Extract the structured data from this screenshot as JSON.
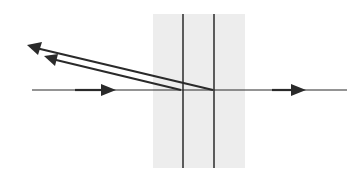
{
  "diagram": {
    "type": "thin-film-reflection",
    "background": "#ffffff",
    "line_color": "#2a2a2a",
    "film_shade_color": "#ededed",
    "film_region": {
      "x1": 153,
      "x2": 245,
      "y1": 14,
      "y2": 168
    },
    "interfaces": [
      {
        "name": "front-surface",
        "x": 183,
        "y1": 14,
        "y2": 168
      },
      {
        "name": "back-surface",
        "x": 214,
        "y1": 14,
        "y2": 168
      }
    ],
    "axis": {
      "y": 90,
      "x1": 32,
      "x2": 347
    },
    "rays": [
      {
        "name": "incident-ray",
        "from": [
          32,
          90
        ],
        "to": [
          183,
          90
        ],
        "arrow_at": [
          115,
          90
        ],
        "direction": "right"
      },
      {
        "name": "transmitted-ray",
        "from": [
          214,
          90
        ],
        "to": [
          347,
          90
        ],
        "arrow_at": [
          305,
          90
        ],
        "direction": "right"
      },
      {
        "name": "reflected-ray-front",
        "from": [
          180,
          90
        ],
        "to": [
          46,
          58
        ],
        "direction": "left"
      },
      {
        "name": "reflected-ray-back",
        "from": [
          212,
          90
        ],
        "to": [
          29,
          46
        ],
        "direction": "left"
      }
    ]
  }
}
